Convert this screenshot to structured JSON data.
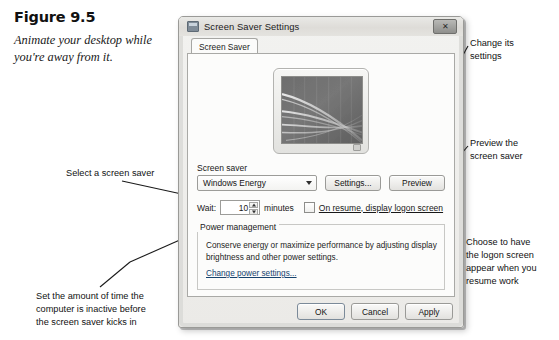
{
  "figure": {
    "number": "Figure 9.5",
    "caption": "Animate your desktop while you're away from it."
  },
  "annotations": {
    "select_screen_saver": "Select a screen saver",
    "set_wait_time": "Set the amount of time the\ncomputer is inactive before\nthe screen saver kicks in",
    "change_settings": "Change its\nsettings",
    "preview": "Preview the\nscreen saver",
    "logon": "Choose to have\nthe logon screen\nappear when you\nresume work"
  },
  "dialog": {
    "title": "Screen Saver Settings",
    "app_icon": "monitor-icon",
    "close_label": "✕",
    "tabs": [
      {
        "label": "Screen Saver",
        "selected": true
      }
    ],
    "preview_monitor": {
      "name": "screen-saver-preview",
      "screensaver": "Windows Energy"
    },
    "screen_saver": {
      "label": "Screen saver",
      "selected": "Windows Energy",
      "options": [
        "(None)",
        "3D Text",
        "Blank",
        "Bubbles",
        "Mystify",
        "Photos",
        "Ribbons",
        "Windows Energy"
      ],
      "settings_button": "Settings...",
      "preview_button": "Preview"
    },
    "wait": {
      "label": "Wait:",
      "value": "10",
      "unit": "minutes",
      "checkbox_label": "On resume, display logon screen",
      "checkbox_checked": false
    },
    "power": {
      "title": "Power management",
      "description": "Conserve energy or maximize performance by adjusting display brightness and other power settings.",
      "link": "Change power settings..."
    },
    "footer": {
      "ok": "OK",
      "cancel": "Cancel",
      "apply": "Apply"
    }
  },
  "colors": {
    "link": "#16436e",
    "dialog_bg": "#efeeeb",
    "panel_bg": "#fcfcfb"
  }
}
